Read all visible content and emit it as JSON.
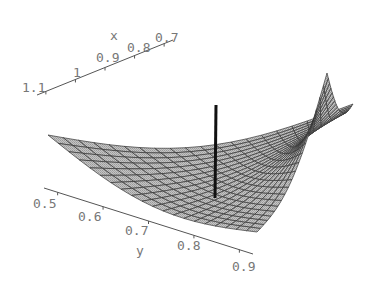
{
  "chart_data": {
    "type": "surface3d",
    "title": "",
    "xlabel": "x",
    "ylabel": "y",
    "zlabel": "",
    "x_ticks": [
      "1.1",
      "1",
      "0.9",
      "0.8",
      "0.7"
    ],
    "y_ticks": [
      "0.5",
      "0.6",
      "0.7",
      "0.8",
      "0.9"
    ],
    "x_range": [
      0.7,
      1.1
    ],
    "y_range": [
      0.5,
      0.9
    ],
    "surface": {
      "shape": "saddle-like bowl, edges curving upward",
      "grid_lines": 20,
      "fill_color": "#b8b8b8",
      "mesh_color": "#333333"
    },
    "marker_line": {
      "description": "vertical black line through surface",
      "color": "#111111"
    },
    "grid": false,
    "legend": null
  },
  "axes": {
    "x": {
      "label": "x",
      "ticks": [
        {
          "label": "1.1",
          "x": 22,
          "y": 92
        },
        {
          "label": "1",
          "x": 73,
          "y": 77
        },
        {
          "label": "0.9",
          "x": 96,
          "y": 62
        },
        {
          "label": "0.8",
          "x": 127,
          "y": 52
        },
        {
          "label": "0.7",
          "x": 155,
          "y": 42
        }
      ],
      "label_pos": {
        "x": 110,
        "y": 40
      }
    },
    "y": {
      "label": "y",
      "ticks": [
        {
          "label": "0.5",
          "x": 33,
          "y": 208
        },
        {
          "label": "0.6",
          "x": 78,
          "y": 221
        },
        {
          "label": "0.7",
          "x": 125,
          "y": 235
        },
        {
          "label": "0.8",
          "x": 177,
          "y": 250
        },
        {
          "label": "0.9",
          "x": 232,
          "y": 271
        }
      ],
      "label_pos": {
        "x": 136,
        "y": 255
      }
    }
  }
}
